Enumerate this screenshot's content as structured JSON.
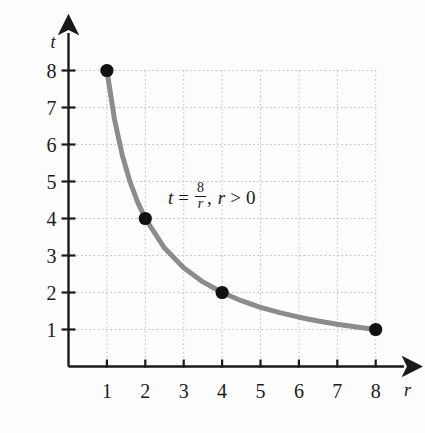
{
  "chart_data": {
    "type": "line",
    "title": "",
    "equation_text": "t = 8/r,  r > 0",
    "equation": {
      "lhs": "t",
      "equals": "=",
      "numerator": "8",
      "denominator": "r",
      "comma": ",",
      "domain_var": "r",
      "domain_op": ">",
      "domain_value": "0"
    },
    "xlabel": "r",
    "ylabel": "t",
    "xlim": [
      0,
      8.6
    ],
    "ylim": [
      0,
      8.6
    ],
    "xticks": [
      1,
      2,
      3,
      4,
      5,
      6,
      7,
      8
    ],
    "yticks": [
      1,
      2,
      3,
      4,
      5,
      6,
      7,
      8
    ],
    "xtick_labels": [
      "1",
      "2",
      "3",
      "4",
      "5",
      "6",
      "7",
      "8"
    ],
    "ytick_labels": [
      "1",
      "2",
      "3",
      "4",
      "5",
      "6",
      "7",
      "8"
    ],
    "grid": true,
    "grid_style": "dotted",
    "legend": "none",
    "curve": {
      "name": "t = 8/r",
      "color": "#8c8c8c",
      "width": 5,
      "x": [
        1,
        1.2,
        1.4,
        1.6,
        1.8,
        2,
        2.5,
        3,
        3.5,
        4,
        4.5,
        5,
        5.5,
        6,
        6.5,
        7,
        7.5,
        8
      ],
      "y": [
        8,
        6.667,
        5.714,
        5,
        4.444,
        4,
        3.2,
        2.667,
        2.286,
        2,
        1.778,
        1.6,
        1.455,
        1.333,
        1.231,
        1.143,
        1.067,
        1
      ]
    },
    "points": [
      {
        "x": 1,
        "y": 8,
        "label": "(1, 8)"
      },
      {
        "x": 2,
        "y": 4,
        "label": "(2, 4)"
      },
      {
        "x": 4,
        "y": 2,
        "label": "(4, 2)"
      },
      {
        "x": 8,
        "y": 1,
        "label": "(8, 1)"
      }
    ],
    "point_color": "#111111",
    "axis_color": "#1a1a1a",
    "grid_color": "#bfbfbf",
    "background_color": "#fdfdfd"
  }
}
